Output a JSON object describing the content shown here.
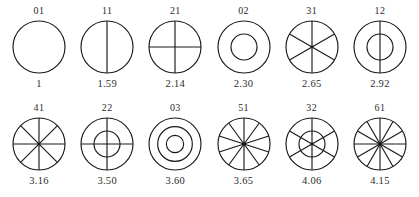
{
  "figure": {
    "title": "",
    "caption": "",
    "stroke_color": "#1a1a1a",
    "text_color": "#2b2b2b",
    "background": "#ffffff"
  },
  "chart_data": {
    "type": "table",
    "title": "",
    "subtitle": "",
    "xlabel": "",
    "ylabel": "",
    "grid": false,
    "legend": "none",
    "columns": [
      "code",
      "value",
      "diameters",
      "circles"
    ],
    "rows": [
      {
        "code": "01",
        "value": "1",
        "diameters": 0,
        "circles": 1
      },
      {
        "code": "11",
        "value": "1.59",
        "diameters": 1,
        "circles": 1
      },
      {
        "code": "21",
        "value": "2.14",
        "diameters": 2,
        "circles": 1
      },
      {
        "code": "02",
        "value": "2.30",
        "diameters": 0,
        "circles": 2
      },
      {
        "code": "31",
        "value": "2.65",
        "diameters": 3,
        "circles": 1
      },
      {
        "code": "12",
        "value": "2.92",
        "diameters": 1,
        "circles": 2
      },
      {
        "code": "41",
        "value": "3.16",
        "diameters": 4,
        "circles": 1
      },
      {
        "code": "22",
        "value": "3.50",
        "diameters": 2,
        "circles": 2
      },
      {
        "code": "03",
        "value": "3.60",
        "diameters": 0,
        "circles": 3
      },
      {
        "code": "51",
        "value": "3.65",
        "diameters": 5,
        "circles": 1
      },
      {
        "code": "32",
        "value": "4.06",
        "diameters": 3,
        "circles": 2
      },
      {
        "code": "61",
        "value": "4.15",
        "diameters": 6,
        "circles": 1
      }
    ],
    "categories": [
      "01",
      "11",
      "21",
      "02",
      "31",
      "12",
      "41",
      "22",
      "03",
      "51",
      "32",
      "61"
    ],
    "values": [
      1,
      1.59,
      2.14,
      2.3,
      2.65,
      2.92,
      3.16,
      3.5,
      3.6,
      3.65,
      4.06,
      4.15
    ]
  },
  "rows": {
    "top": [
      {
        "code": "01",
        "value": "1",
        "diameters": 0,
        "circles": 1,
        "name": "circle-glyph-01"
      },
      {
        "code": "11",
        "value": "1.59",
        "diameters": 1,
        "circles": 1,
        "name": "circle-glyph-11"
      },
      {
        "code": "21",
        "value": "2.14",
        "diameters": 2,
        "circles": 1,
        "name": "circle-glyph-21"
      },
      {
        "code": "02",
        "value": "2.30",
        "diameters": 0,
        "circles": 2,
        "name": "circle-glyph-02"
      },
      {
        "code": "31",
        "value": "2.65",
        "diameters": 3,
        "circles": 1,
        "name": "circle-glyph-31"
      },
      {
        "code": "12",
        "value": "2.92",
        "diameters": 1,
        "circles": 2,
        "name": "circle-glyph-12"
      }
    ],
    "bottom": [
      {
        "code": "41",
        "value": "3.16",
        "diameters": 4,
        "circles": 1,
        "name": "circle-glyph-41"
      },
      {
        "code": "22",
        "value": "3.50",
        "diameters": 2,
        "circles": 2,
        "name": "circle-glyph-22"
      },
      {
        "code": "03",
        "value": "3.60",
        "diameters": 0,
        "circles": 3,
        "name": "circle-glyph-03"
      },
      {
        "code": "51",
        "value": "3.65",
        "diameters": 5,
        "circles": 1,
        "name": "circle-glyph-51"
      },
      {
        "code": "32",
        "value": "4.06",
        "diameters": 3,
        "circles": 2,
        "name": "circle-glyph-32"
      },
      {
        "code": "61",
        "value": "4.15",
        "diameters": 6,
        "circles": 1,
        "name": "circle-glyph-61"
      }
    ]
  }
}
